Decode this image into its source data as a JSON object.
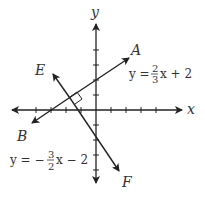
{
  "diagram": {
    "axes": {
      "x_label": "x",
      "y_label": "y",
      "origin": [
        96,
        110
      ],
      "tick_spacing_px": 15
    },
    "lines": [
      {
        "name": "AB",
        "equation_prefix": "y =",
        "num": "2",
        "den": "3",
        "equation_suffix": "x + 2",
        "label_start": "B",
        "label_end": "A"
      },
      {
        "name": "EF",
        "equation_prefix": "y = −",
        "num": "3",
        "den": "2",
        "equation_suffix": "x − 2",
        "label_start": "E",
        "label_end": "F"
      }
    ],
    "right_angle_marker": true,
    "colors": {
      "stroke": "#222222",
      "text": "#333333"
    }
  }
}
